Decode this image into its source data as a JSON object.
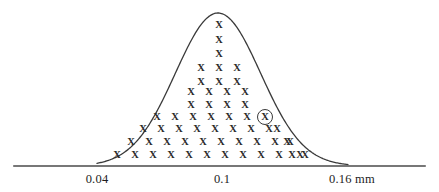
{
  "figure": {
    "title": "",
    "background_color": "#ffffff",
    "ink_color": "#333333",
    "baseline": {
      "y": 166,
      "x_start": 14,
      "x_end": 425,
      "color": "#4a4a4a",
      "thickness": 1.6
    },
    "curve": {
      "shape": "normal-bell-curve",
      "color": "#3a3a3a",
      "thickness": 1.3,
      "apex_x": 218,
      "apex_y": 13,
      "left_foot_x": 97,
      "right_foot_x": 348
    },
    "axis_labels": [
      {
        "text": "0.04",
        "x": 97,
        "y": 172
      },
      {
        "text": "0.1",
        "x": 222,
        "y": 172
      },
      {
        "text": "0.16 mm",
        "x": 352,
        "y": 172
      }
    ],
    "mark_glyph": "X",
    "circled_mark": {
      "x": 265,
      "y": 117,
      "radius": 8
    }
  },
  "chart_data": {
    "type": "bar",
    "title": "",
    "subtitle": "",
    "xlabel": "mm",
    "ylabel": "",
    "xlim": [
      0.04,
      0.16
    ],
    "grid": false,
    "legend": null,
    "plot_style": "dot-plot-under-normal-curve",
    "unit": "mm",
    "mean": 0.1,
    "tick_labels": [
      "0.04",
      "0.1",
      "0.16 mm"
    ],
    "tick_values": [
      0.04,
      0.1,
      0.16
    ],
    "rows": [
      {
        "row": 1,
        "y": 25,
        "count": 1,
        "x_positions": [
          219
        ]
      },
      {
        "row": 2,
        "y": 40,
        "count": 1,
        "x_positions": [
          219
        ]
      },
      {
        "row": 3,
        "y": 54,
        "count": 1,
        "x_positions": [
          219
        ]
      },
      {
        "row": 4,
        "y": 68,
        "count": 3,
        "x_positions": [
          201,
          219,
          237
        ]
      },
      {
        "row": 5,
        "y": 82,
        "count": 3,
        "x_positions": [
          201,
          219,
          237
        ]
      },
      {
        "row": 6,
        "y": 92,
        "count": 4,
        "x_positions": [
          191,
          209,
          227,
          245
        ]
      },
      {
        "row": 7,
        "y": 105,
        "count": 4,
        "x_positions": [
          191,
          209,
          227,
          245
        ]
      },
      {
        "row": 8,
        "y": 117,
        "count": 7,
        "x_positions": [
          157,
          175,
          193,
          211,
          229,
          247,
          265
        ],
        "circled_index": 6
      },
      {
        "row": 9,
        "y": 129,
        "count": 9,
        "x_positions": [
          143,
          161,
          179,
          197,
          215,
          233,
          251,
          269,
          277
        ]
      },
      {
        "row": 10,
        "y": 142,
        "count": 11,
        "x_positions": [
          131,
          149,
          167,
          185,
          203,
          221,
          239,
          257,
          275,
          287,
          290
        ]
      },
      {
        "row": 11,
        "y": 155,
        "count": 13,
        "x_positions": [
          117,
          135,
          153,
          171,
          189,
          207,
          225,
          243,
          261,
          279,
          292,
          300,
          305
        ]
      }
    ],
    "row_counts": [
      1,
      1,
      1,
      3,
      3,
      4,
      4,
      7,
      9,
      11,
      13
    ],
    "total_marks": 57,
    "circled_marks": 1
  }
}
